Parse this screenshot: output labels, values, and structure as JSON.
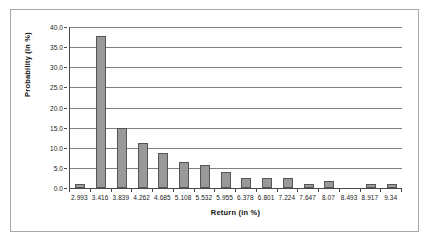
{
  "chart_data": {
    "type": "bar",
    "title": "",
    "subtitle": "",
    "xlabel": "Return (in %)",
    "ylabel": "Probability (in %)",
    "categories": [
      "2.993",
      "3.416",
      "3.839",
      "4.262",
      "4.685",
      "5.108",
      "5.532",
      "5.955",
      "6.378",
      "6.801",
      "7.224",
      "7.647",
      "8.07",
      "8.493",
      "8.917",
      "9.34"
    ],
    "values": [
      0.9,
      37.8,
      15.0,
      11.1,
      8.8,
      6.4,
      5.6,
      4.1,
      2.5,
      2.5,
      2.5,
      0.9,
      1.8,
      0.0,
      0.9,
      0.9
    ],
    "ylim": [
      0.0,
      40.0
    ],
    "ytick_labels": [
      "0.0",
      "5.0",
      "10.0",
      "15.0",
      "20.0",
      "25.0",
      "30.0",
      "35.0",
      "40.0"
    ],
    "ytick_values": [
      0.0,
      5.0,
      10.0,
      15.0,
      20.0,
      25.0,
      30.0,
      35.0,
      40.0
    ],
    "grid": true,
    "grid_axis": "y",
    "legend": false,
    "legend_position": "none",
    "bar_color": "#999999",
    "bar_border_color": "#555555",
    "gridline_color": "#808080",
    "axis_color": "#4a4a4a",
    "frame_color": "#a8a8a8",
    "background": "#ffffff"
  }
}
